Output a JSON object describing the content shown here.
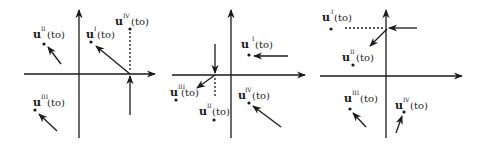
{
  "figure": {
    "color": "#1a1a1a",
    "panels": [
      {
        "id": "panel-1",
        "labels": [
          {
            "base": "u",
            "sup": "II",
            "arg": "(to)"
          },
          {
            "base": "u",
            "sup": "I",
            "arg": "(to)"
          },
          {
            "base": "u",
            "sup": "IV",
            "arg": "(to)"
          },
          {
            "base": "u",
            "sup": "III",
            "arg": "(to)"
          }
        ]
      },
      {
        "id": "panel-2",
        "labels": [
          {
            "base": "u",
            "sup": "I",
            "arg": "(to)"
          },
          {
            "base": "u",
            "sup": "III",
            "arg": "(to)"
          },
          {
            "base": "u",
            "sup": "II",
            "arg": "(to)"
          },
          {
            "base": "u",
            "sup": "IV",
            "arg": "(to)"
          }
        ]
      },
      {
        "id": "panel-3",
        "labels": [
          {
            "base": "u",
            "sup": "I",
            "arg": "(to)"
          },
          {
            "base": "u",
            "sup": "II",
            "arg": "(to)"
          },
          {
            "base": "u",
            "sup": "III",
            "arg": "(to)"
          },
          {
            "base": "u",
            "sup": "IV",
            "arg": "(to)"
          }
        ]
      }
    ]
  }
}
